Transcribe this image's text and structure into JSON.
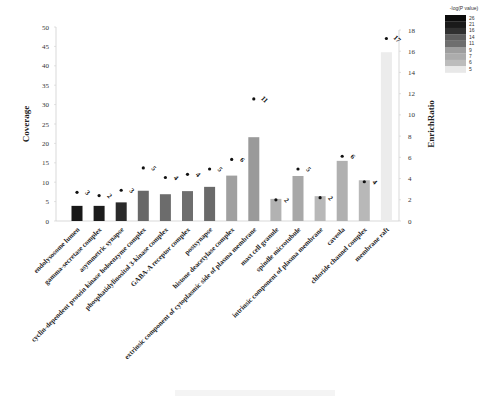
{
  "chart_data": {
    "type": "bar",
    "title": "",
    "xlabel": "",
    "ylabel": "Coverage",
    "y2label": "EnrichRatio",
    "ylim": [
      0,
      50
    ],
    "y2lim": [
      0,
      18
    ],
    "yticks": [
      0,
      5,
      10,
      15,
      20,
      25,
      30,
      35,
      40,
      45,
      50
    ],
    "y2ticks": [
      0,
      2,
      4,
      6,
      8,
      10,
      12,
      14,
      16,
      18
    ],
    "grid": false,
    "legend_position": "top-right",
    "categories": [
      "endolysosome lumen",
      "gamma-secretase complex",
      "asymmetric synapse",
      "cyclin-dependent protein kinase holoenzyme complex",
      "phosphatidylinositol 3-kinase complex",
      "GABA-A receptor complex",
      "postsynapse",
      "histone deacetylase complex",
      "extrinsic component of cytoplasmic side of plasma membrane",
      "mast cell granule",
      "spindle microtubule",
      "intrinsic component of plasma membrane",
      "caveola",
      "chloride channel complex",
      "membrane raft"
    ],
    "series": [
      {
        "name": "Coverage",
        "type": "bar",
        "axis": "left",
        "values": [
          3.9,
          3.9,
          4.8,
          7.8,
          6.9,
          7.7,
          8.8,
          11.7,
          21.6,
          5.7,
          11.6,
          6.4,
          15.5,
          10.5,
          43.5
        ]
      },
      {
        "name": "EnrichRatio",
        "type": "scatter",
        "axis": "right",
        "values": [
          2.7,
          2.4,
          2.9,
          5.0,
          4.1,
          4.4,
          4.9,
          5.8,
          11.5,
          2.0,
          4.9,
          2.2,
          6.1,
          3.7,
          17.2
        ]
      }
    ],
    "gene_counts": [
      3,
      2,
      3,
      5,
      4,
      4,
      5,
      6,
      11,
      2,
      5,
      2,
      6,
      4,
      17
    ],
    "bar_colors": [
      "#181818",
      "#1c1c1c",
      "#2a2a2a",
      "#686868",
      "#6c6c6c",
      "#6e6e6e",
      "#6a6a6a",
      "#a0a0a0",
      "#9a9a9a",
      "#b2b2b2",
      "#a8a8a8",
      "#b8b8b8",
      "#b0b0b0",
      "#b8b8b8",
      "#ececec"
    ],
    "legend": {
      "title": "-log(P value)",
      "values": [
        "26",
        "21",
        "16",
        "14",
        "11",
        "9",
        "7",
        "6",
        "5"
      ],
      "colors": [
        "#0c0c0c",
        "#1a1a1a",
        "#303030",
        "#5e5e5e",
        "#6e6e6e",
        "#9e9e9e",
        "#acacac",
        "#bcbcbc",
        "#e8e8e8"
      ]
    }
  }
}
